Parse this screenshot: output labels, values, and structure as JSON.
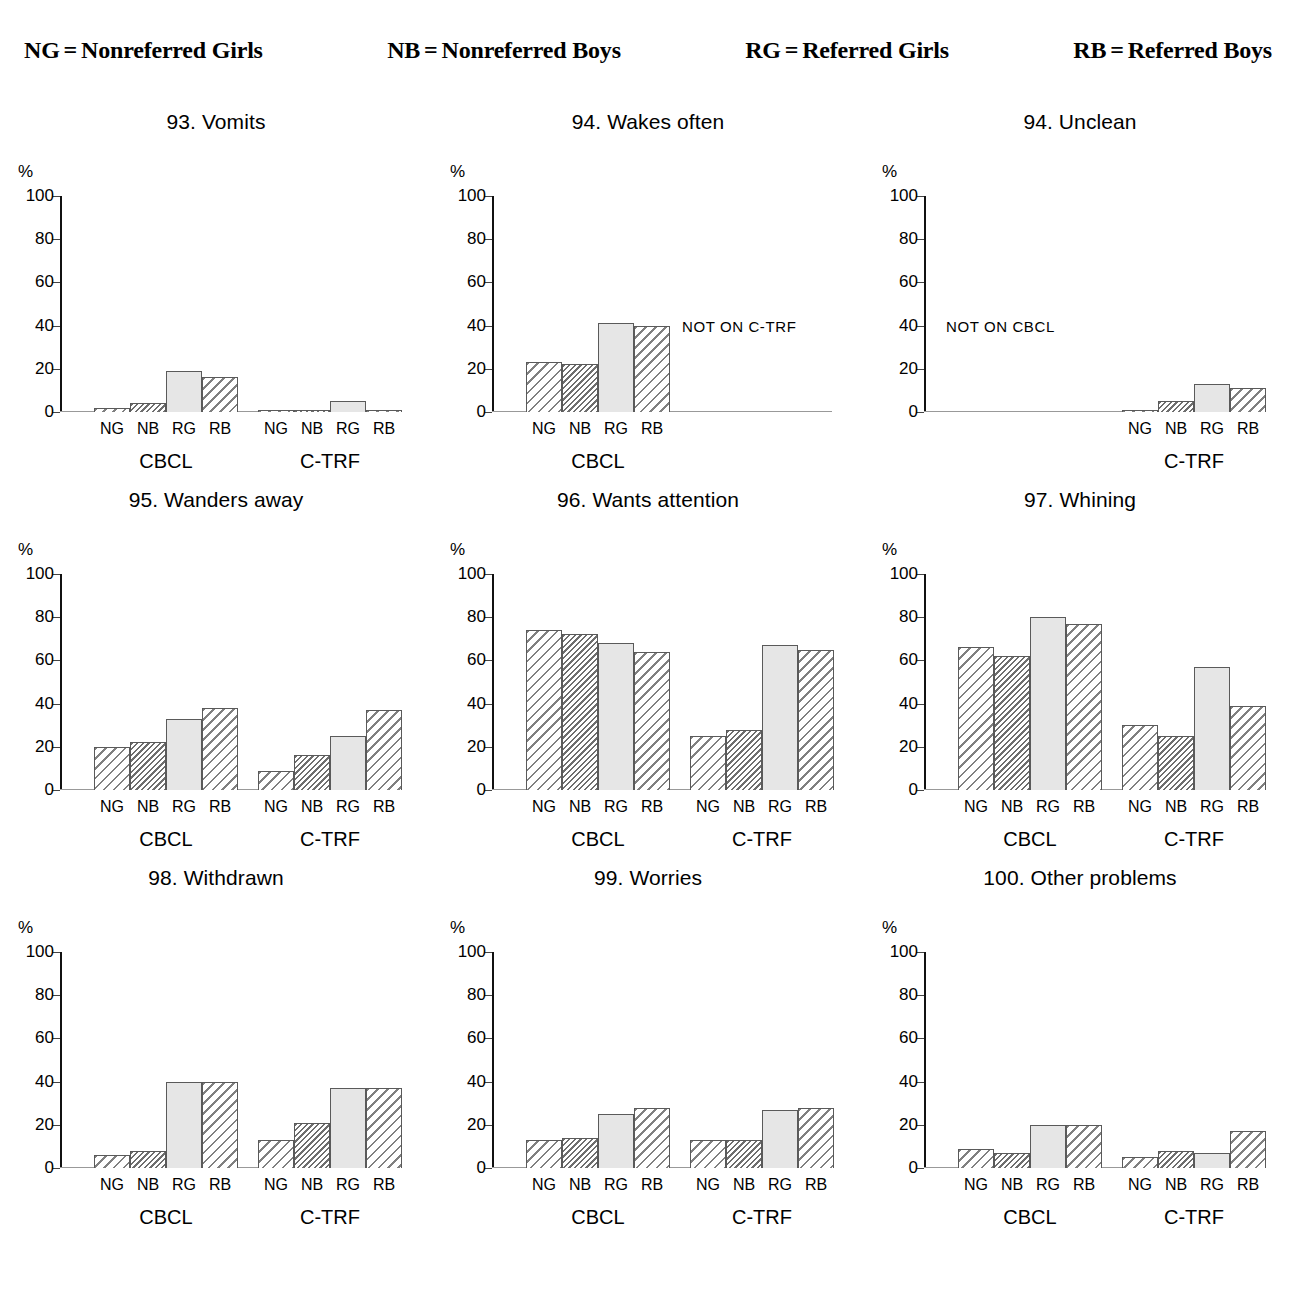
{
  "legend": {
    "entries": [
      {
        "abbr": "NG",
        "eq": "=",
        "text": "Nonreferred Girls"
      },
      {
        "abbr": "NB",
        "eq": "=",
        "text": "Nonreferred Boys"
      },
      {
        "abbr": "RG",
        "eq": "=",
        "text": "Referred Girls"
      },
      {
        "abbr": "RB",
        "eq": "=",
        "text": "Referred Boys"
      }
    ]
  },
  "axis": {
    "y_unit": "%",
    "ticks": [
      "100",
      "80",
      "60",
      "40",
      "20",
      "0"
    ],
    "categories": [
      "NG",
      "NB",
      "RG",
      "RB"
    ],
    "groups": [
      "CBCL",
      "C-TRF"
    ]
  },
  "chart_data": [
    {
      "type": "bar",
      "title": "93. Vomits",
      "ylabel": "%",
      "ylim": [
        0,
        100
      ],
      "yticks": [
        0,
        20,
        40,
        60,
        80,
        100
      ],
      "grid": false,
      "categories": [
        "NG",
        "NB",
        "RG",
        "RB"
      ],
      "groups": [
        "CBCL",
        "C-TRF"
      ],
      "series": [
        {
          "name": "CBCL",
          "values": [
            2,
            4,
            19,
            16
          ]
        },
        {
          "name": "C-TRF",
          "values": [
            1,
            1,
            5,
            1
          ]
        }
      ],
      "note": null
    },
    {
      "type": "bar",
      "title": "94. Wakes often",
      "ylabel": "%",
      "ylim": [
        0,
        100
      ],
      "yticks": [
        0,
        20,
        40,
        60,
        80,
        100
      ],
      "grid": false,
      "categories": [
        "NG",
        "NB",
        "RG",
        "RB"
      ],
      "groups": [
        "CBCL"
      ],
      "series": [
        {
          "name": "CBCL",
          "values": [
            23,
            22,
            41,
            40
          ]
        }
      ],
      "note": "NOT ON C-TRF"
    },
    {
      "type": "bar",
      "title": "94. Unclean",
      "ylabel": "%",
      "ylim": [
        0,
        100
      ],
      "yticks": [
        0,
        20,
        40,
        60,
        80,
        100
      ],
      "grid": false,
      "categories": [
        "NG",
        "NB",
        "RG",
        "RB"
      ],
      "groups": [
        "C-TRF"
      ],
      "series": [
        {
          "name": "C-TRF",
          "values": [
            1,
            5,
            13,
            11
          ]
        }
      ],
      "note": "NOT ON CBCL"
    },
    {
      "type": "bar",
      "title": "95. Wanders away",
      "ylabel": "%",
      "ylim": [
        0,
        100
      ],
      "yticks": [
        0,
        20,
        40,
        60,
        80,
        100
      ],
      "grid": false,
      "categories": [
        "NG",
        "NB",
        "RG",
        "RB"
      ],
      "groups": [
        "CBCL",
        "C-TRF"
      ],
      "series": [
        {
          "name": "CBCL",
          "values": [
            20,
            22,
            33,
            38
          ]
        },
        {
          "name": "C-TRF",
          "values": [
            9,
            16,
            25,
            37
          ]
        }
      ],
      "note": null
    },
    {
      "type": "bar",
      "title": "96. Wants attention",
      "ylabel": "%",
      "ylim": [
        0,
        100
      ],
      "yticks": [
        0,
        20,
        40,
        60,
        80,
        100
      ],
      "grid": false,
      "categories": [
        "NG",
        "NB",
        "RG",
        "RB"
      ],
      "groups": [
        "CBCL",
        "C-TRF"
      ],
      "series": [
        {
          "name": "CBCL",
          "values": [
            74,
            72,
            68,
            64
          ]
        },
        {
          "name": "C-TRF",
          "values": [
            25,
            28,
            67,
            65
          ]
        }
      ],
      "note": null
    },
    {
      "type": "bar",
      "title": "97. Whining",
      "ylabel": "%",
      "ylim": [
        0,
        100
      ],
      "yticks": [
        0,
        20,
        40,
        60,
        80,
        100
      ],
      "grid": false,
      "categories": [
        "NG",
        "NB",
        "RG",
        "RB"
      ],
      "groups": [
        "CBCL",
        "C-TRF"
      ],
      "series": [
        {
          "name": "CBCL",
          "values": [
            66,
            62,
            80,
            77
          ]
        },
        {
          "name": "C-TRF",
          "values": [
            30,
            25,
            57,
            39
          ]
        }
      ],
      "note": null
    },
    {
      "type": "bar",
      "title": "98. Withdrawn",
      "ylabel": "%",
      "ylim": [
        0,
        100
      ],
      "yticks": [
        0,
        20,
        40,
        60,
        80,
        100
      ],
      "grid": false,
      "categories": [
        "NG",
        "NB",
        "RG",
        "RB"
      ],
      "groups": [
        "CBCL",
        "C-TRF"
      ],
      "series": [
        {
          "name": "CBCL",
          "values": [
            6,
            8,
            40,
            40
          ]
        },
        {
          "name": "C-TRF",
          "values": [
            13,
            21,
            37,
            37
          ]
        }
      ],
      "note": null
    },
    {
      "type": "bar",
      "title": "99. Worries",
      "ylabel": "%",
      "ylim": [
        0,
        100
      ],
      "yticks": [
        0,
        20,
        40,
        60,
        80,
        100
      ],
      "grid": false,
      "categories": [
        "NG",
        "NB",
        "RG",
        "RB"
      ],
      "groups": [
        "CBCL",
        "C-TRF"
      ],
      "series": [
        {
          "name": "CBCL",
          "values": [
            13,
            14,
            25,
            28
          ]
        },
        {
          "name": "C-TRF",
          "values": [
            13,
            13,
            27,
            28
          ]
        }
      ],
      "note": null
    },
    {
      "type": "bar",
      "title": "100. Other problems",
      "ylabel": "%",
      "ylim": [
        0,
        100
      ],
      "yticks": [
        0,
        20,
        40,
        60,
        80,
        100
      ],
      "grid": false,
      "categories": [
        "NG",
        "NB",
        "RG",
        "RB"
      ],
      "groups": [
        "CBCL",
        "C-TRF"
      ],
      "series": [
        {
          "name": "CBCL",
          "values": [
            9,
            7,
            20,
            20
          ]
        },
        {
          "name": "C-TRF",
          "values": [
            5,
            8,
            7,
            17
          ]
        }
      ],
      "note": null
    }
  ]
}
